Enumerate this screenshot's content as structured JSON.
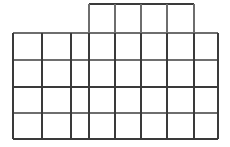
{
  "figure": {
    "background_color": "#ffffff",
    "line_color": "#3a3a3a",
    "line_color_light": "#6e6e6e",
    "line_width": 1.4,
    "canvas": {
      "width": 230,
      "height": 147
    },
    "upper_block": {
      "name": "upper-block",
      "columns": 5,
      "rows": 1,
      "x_left": 89,
      "x_right": 194,
      "y_top": 4,
      "y_bottom": 33,
      "cell_count": 5
    },
    "lower_block": {
      "name": "lower-block",
      "columns": 7,
      "rows": 4,
      "x_left": 13,
      "x_right": 218,
      "y_top": 33,
      "y_bottom": 139,
      "cell_count": 28
    },
    "vertical_lines_upper": [
      89,
      115,
      141,
      167,
      194
    ],
    "vertical_lines_lower": [
      13,
      42,
      71,
      89,
      115,
      141,
      167,
      194,
      218
    ],
    "horizontal_lines_upper": [
      4,
      33
    ],
    "horizontal_lines_lower": [
      33,
      60,
      87,
      113,
      139
    ],
    "total_cells": 33
  }
}
